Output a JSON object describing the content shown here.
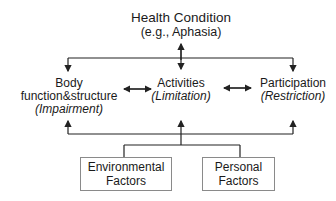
{
  "health_condition": {
    "title": "Health Condition",
    "example": "(e.g., Aphasia)"
  },
  "components": [
    {
      "line1": "Body",
      "line2": "function&structure",
      "qualifier": "(Impairment)"
    },
    {
      "line1": "Activities",
      "qualifier": "(Limitation)"
    },
    {
      "line1": "Participation",
      "qualifier": "(Restriction)"
    }
  ],
  "contextual_factors": [
    {
      "line1": "Environmental",
      "line2": "Factors"
    },
    {
      "line1": "Personal",
      "line2": "Factors"
    }
  ],
  "colors": {
    "line": "#222222",
    "box_border": "#8a8a8a",
    "text": "#1a1a1a"
  }
}
